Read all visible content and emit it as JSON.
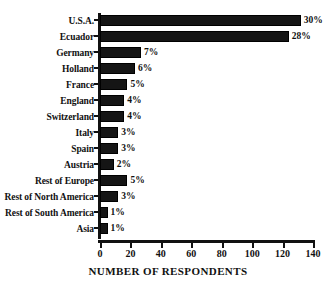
{
  "chart_data": {
    "type": "bar",
    "orientation": "horizontal",
    "title": "",
    "xlabel": "NUMBER OF RESPONDENTS",
    "ylabel": "",
    "xlim": [
      0,
      140
    ],
    "xticks": [
      0,
      20,
      40,
      60,
      80,
      100,
      120,
      140
    ],
    "grid": false,
    "legend": null,
    "bar_color": "#151515",
    "categories": [
      "U.S.A.",
      "Ecuador",
      "Germany",
      "Holland",
      "France",
      "England",
      "Switzerland",
      "Italy",
      "Spain",
      "Austria",
      "Rest of Europe",
      "Rest of North America",
      "Rest of South America",
      "Asia"
    ],
    "values": [
      132,
      124,
      27,
      23,
      18,
      16,
      16,
      12,
      12,
      9,
      18,
      12,
      5,
      5
    ],
    "data_labels": [
      "30%",
      "28%",
      "7%",
      "6%",
      "5%",
      "4%",
      "4%",
      "3%",
      "3%",
      "2%",
      "5%",
      "3%",
      "1%",
      "1%"
    ]
  }
}
